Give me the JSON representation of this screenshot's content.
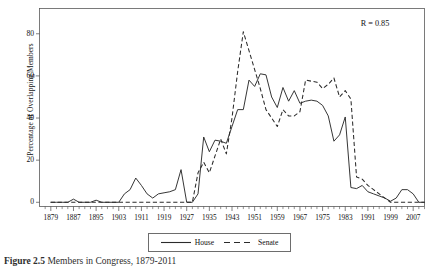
{
  "figure": {
    "caption_label": "Figure 2.5",
    "caption_text": "Members in Congress, 1879-2011"
  },
  "annotation": {
    "correlation": "R = 0.85"
  },
  "legend": {
    "items": [
      {
        "label": "House",
        "style": "solid"
      },
      {
        "label": "Senate",
        "style": "dashed"
      }
    ]
  },
  "chart_data": {
    "type": "line",
    "title": "",
    "xlabel": "",
    "ylabel": "Percentage of Overlapping Members",
    "xlim": [
      1875,
      2011
    ],
    "ylim": [
      -2,
      92
    ],
    "grid": true,
    "legend_position": "bottom",
    "ytick_labels": [
      "0",
      "20",
      "40",
      "60",
      "80"
    ],
    "ytick_values": [
      0,
      20,
      40,
      60,
      80
    ],
    "gridline_values": [
      0,
      10,
      20,
      30,
      40,
      50,
      60,
      70,
      80,
      90
    ],
    "xtick_labels": [
      "1879",
      "1887",
      "1895",
      "1903",
      "1911",
      "1919",
      "1927",
      "1935",
      "1943",
      "1951",
      "1959",
      "1967",
      "1975",
      "1983",
      "1991",
      "1999",
      "2007"
    ],
    "xtick_values": [
      1879,
      1887,
      1895,
      1903,
      1911,
      1919,
      1927,
      1935,
      1943,
      1951,
      1959,
      1967,
      1975,
      1983,
      1991,
      1999,
      2007
    ],
    "x": [
      1879,
      1881,
      1883,
      1885,
      1887,
      1889,
      1891,
      1893,
      1895,
      1897,
      1899,
      1901,
      1903,
      1905,
      1907,
      1909,
      1911,
      1913,
      1915,
      1917,
      1919,
      1921,
      1923,
      1925,
      1927,
      1929,
      1931,
      1933,
      1935,
      1937,
      1939,
      1941,
      1943,
      1945,
      1947,
      1949,
      1951,
      1953,
      1955,
      1957,
      1959,
      1961,
      1963,
      1965,
      1967,
      1969,
      1971,
      1973,
      1975,
      1977,
      1979,
      1981,
      1983,
      1985,
      1987,
      1989,
      1991,
      1993,
      1995,
      1997,
      1999,
      2001,
      2003,
      2005,
      2007,
      2009,
      2011
    ],
    "series": [
      {
        "name": "House",
        "style": "solid",
        "values": [
          0,
          0,
          0,
          0,
          1.5,
          0,
          0,
          0,
          1,
          0,
          0,
          0,
          0,
          4,
          6,
          11.5,
          8,
          4,
          2,
          4,
          4.5,
          5,
          6,
          15.5,
          0,
          0,
          4,
          31,
          24,
          29.5,
          29,
          28,
          36,
          44,
          44,
          58,
          55,
          61,
          60.5,
          50,
          45,
          54.5,
          48,
          53,
          47,
          48,
          48.5,
          48,
          46,
          41,
          29,
          32,
          40.5,
          7,
          6.5,
          8,
          5,
          4,
          3,
          2,
          0.5,
          2,
          6,
          6,
          4,
          0,
          0
        ]
      },
      {
        "name": "Senate",
        "style": "dashed",
        "values": [
          0,
          0,
          0,
          0,
          0,
          0,
          0,
          0,
          0,
          0,
          0,
          0,
          0,
          0,
          0,
          0,
          0,
          0,
          0,
          0,
          0,
          0,
          0,
          0,
          0,
          0,
          14,
          19,
          14,
          22,
          30,
          23,
          40,
          62,
          81,
          72,
          63,
          54,
          44,
          40,
          36,
          44,
          41,
          41,
          43,
          58,
          57.5,
          57,
          54,
          56,
          59,
          50,
          53,
          49,
          12,
          11,
          8,
          6,
          4,
          2,
          0,
          0,
          0,
          0,
          0,
          0,
          0
        ]
      }
    ]
  }
}
